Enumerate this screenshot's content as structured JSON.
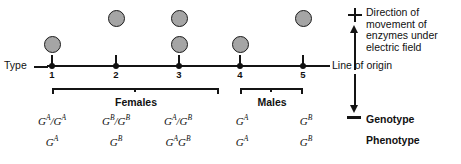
{
  "figure": {
    "axis": {
      "type_label": "Type",
      "ticks": [
        "1",
        "2",
        "3",
        "4",
        "5"
      ]
    },
    "legend": {
      "plus_symbol": "+",
      "minus_symbol": "−",
      "direction_text": "Direction of\nmovement of\nenzymes under\nelectric field",
      "origin_label": "Line of origin"
    },
    "groups": [
      {
        "label": "Females",
        "types": [
          "1",
          "2",
          "3"
        ]
      },
      {
        "label": "Males",
        "types": [
          "4",
          "5"
        ]
      }
    ],
    "rows": {
      "genotype_label": "Genotype",
      "phenotype_label": "Phenotype"
    },
    "columns": [
      {
        "type": "1",
        "bands": [
          "lower"
        ],
        "genotype": "Gᴬ/Gᴬ",
        "phenotype": "Gᴬ",
        "genotype_parts": [
          {
            "base": "G",
            "sup": "A"
          },
          {
            "base": "/G",
            "sup": "A"
          }
        ],
        "phenotype_parts": [
          {
            "base": "G",
            "sup": "A"
          }
        ]
      },
      {
        "type": "2",
        "bands": [
          "upper"
        ],
        "genotype": "Gᴮ/Gᴮ",
        "phenotype": "Gᴮ",
        "genotype_parts": [
          {
            "base": "G",
            "sup": "B"
          },
          {
            "base": "/G",
            "sup": "B"
          }
        ],
        "phenotype_parts": [
          {
            "base": "G",
            "sup": "B"
          }
        ]
      },
      {
        "type": "3",
        "bands": [
          "upper",
          "lower"
        ],
        "genotype": "Gᴬ/Gᴮ",
        "phenotype": "Gᴬ Gᴮ",
        "genotype_parts": [
          {
            "base": "G",
            "sup": "A"
          },
          {
            "base": "/G",
            "sup": "B"
          }
        ],
        "phenotype_parts": [
          {
            "base": "G",
            "sup": "A"
          },
          {
            "base": "G",
            "sup": "B"
          }
        ]
      },
      {
        "type": "4",
        "bands": [
          "lower"
        ],
        "genotype": "Gᴬ",
        "phenotype": "Gᴬ",
        "genotype_parts": [
          {
            "base": "G",
            "sup": "A"
          }
        ],
        "phenotype_parts": [
          {
            "base": "G",
            "sup": "A"
          }
        ]
      },
      {
        "type": "5",
        "bands": [
          "upper"
        ],
        "genotype": "Gᴮ",
        "phenotype": "Gᴮ",
        "genotype_parts": [
          {
            "base": "G",
            "sup": "B"
          }
        ],
        "phenotype_parts": [
          {
            "base": "G",
            "sup": "B"
          }
        ]
      }
    ],
    "colors": {
      "band_fill": "#a5a5a5",
      "band_stroke": "#1b1b1b",
      "ink": "#111111",
      "background": "#ffffff"
    }
  }
}
